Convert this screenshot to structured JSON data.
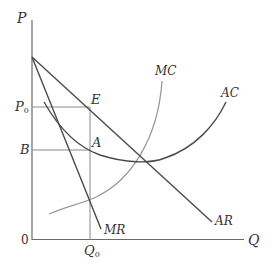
{
  "diagram": {
    "type": "monopoly-price-output",
    "axes": {
      "y_label": "P",
      "x_label": "Q",
      "origin_label": "0"
    },
    "price_levels": {
      "p0": {
        "label": "P",
        "subscript": "0"
      },
      "b": {
        "label": "B"
      }
    },
    "quantity_levels": {
      "q0": {
        "label": "Q",
        "subscript": "0"
      }
    },
    "points": {
      "e": {
        "label": "E"
      },
      "a": {
        "label": "A"
      }
    },
    "curves": {
      "mc": {
        "label": "MC",
        "color": "#9a9a9a"
      },
      "ac": {
        "label": "AC",
        "color": "#4a4a4a"
      },
      "ar": {
        "label": "AR",
        "color": "#4a4a4a"
      },
      "mr": {
        "label": "MR",
        "color": "#4a4a4a"
      }
    },
    "colors": {
      "axis": "#6a6a6a",
      "guide_lines": "#8a8a8a",
      "text": "#333333"
    }
  }
}
